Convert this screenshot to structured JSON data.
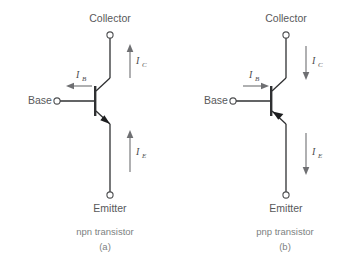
{
  "figure": {
    "background_color": "#ffffff",
    "line_color": "#2f3032",
    "label_color": "#58595b",
    "caption_color": "#7d7f82",
    "current_arrow_color": "#6e6f72"
  },
  "diagrams": [
    {
      "id": "npn",
      "caption_name": "npn transistor",
      "caption_letter": "(a)",
      "terminals": {
        "collector": "Collector",
        "base": "Base",
        "emitter": "Emitter"
      },
      "currents": [
        {
          "name": "collector-current",
          "symbol": "I",
          "subscript": "C",
          "direction": "up"
        },
        {
          "name": "base-current",
          "symbol": "I",
          "subscript": "B",
          "direction": "left"
        },
        {
          "name": "emitter-current",
          "symbol": "I",
          "subscript": "E",
          "direction": "up"
        }
      ],
      "emitter_arrow_direction": "outward"
    },
    {
      "id": "pnp",
      "caption_name": "pnp transistor",
      "caption_letter": "(b)",
      "terminals": {
        "collector": "Collector",
        "base": "Base",
        "emitter": "Emitter"
      },
      "currents": [
        {
          "name": "collector-current",
          "symbol": "I",
          "subscript": "C",
          "direction": "down"
        },
        {
          "name": "base-current",
          "symbol": "I",
          "subscript": "B",
          "direction": "right"
        },
        {
          "name": "emitter-current",
          "symbol": "I",
          "subscript": "E",
          "direction": "down"
        }
      ],
      "emitter_arrow_direction": "inward"
    }
  ]
}
